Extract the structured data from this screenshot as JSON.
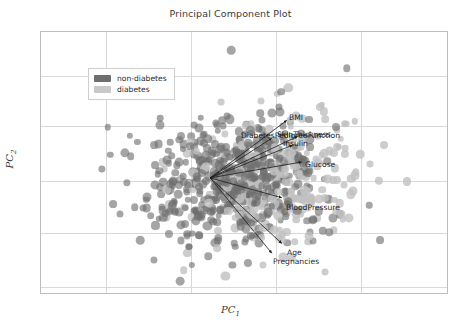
{
  "chart_data": {
    "type": "scatter",
    "title": "Principal Component Plot",
    "xlabel": "PC",
    "xlabel_sub": "1",
    "ylabel": "PC",
    "ylabel_sub": "2",
    "grid": true,
    "xlim": [
      -4,
      10
    ],
    "ylim": [
      -6,
      6
    ],
    "legend": {
      "position": "top-left",
      "entries": [
        {
          "label": "non-diabetes",
          "color": "#6e6e6e"
        },
        {
          "label": "diabetes",
          "color": "#c9c9c9"
        }
      ]
    },
    "loading_vectors": [
      {
        "name": "BMI",
        "label": "BMI",
        "dx": 77,
        "dy": -58,
        "label_x": 288,
        "label_y": 112
      },
      {
        "name": "SkinThickness",
        "label": "SkinThickness",
        "dx": 88,
        "dy": -42,
        "label_x": 276,
        "label_y": 129
      },
      {
        "name": "DiabetesPedigreeFunction",
        "label": "DiabetesPedigreeFunction",
        "dx": 62,
        "dy": -40,
        "label_x": 240,
        "label_y": 130
      },
      {
        "name": "Insulin",
        "label": "Insulin",
        "dx": 83,
        "dy": -33,
        "label_x": 282,
        "label_y": 138
      },
      {
        "name": "Glucose",
        "label": "Glucose",
        "dx": 92,
        "dy": -16,
        "label_x": 304,
        "label_y": 159
      },
      {
        "name": "BloodPressure",
        "label": "BloodPressure",
        "dx": 72,
        "dy": 20,
        "label_x": 285,
        "label_y": 202
      },
      {
        "name": "Age",
        "label": "Age",
        "dx": 72,
        "dy": 66,
        "label_x": 286,
        "label_y": 247
      },
      {
        "name": "Pregnancies",
        "label": "Pregnancies",
        "dx": 62,
        "dy": 76,
        "label_x": 272,
        "label_y": 256
      }
    ],
    "vector_origin": {
      "x": 210,
      "y": 178
    },
    "point_colors": {
      "non_diabetes": "#6e6e6e",
      "diabetes": "#c0c0c0"
    },
    "n_points_approx": 768,
    "gridlines_x_px": [
      105,
      190,
      275,
      360
    ],
    "gridlines_y_px": [
      75,
      125,
      180,
      232,
      286
    ]
  },
  "colors": {
    "frame": "#bdbdbd",
    "grid": "#d9d9d9",
    "text": "#3b3b3b",
    "vector_arrow": "#1a1a1a"
  }
}
